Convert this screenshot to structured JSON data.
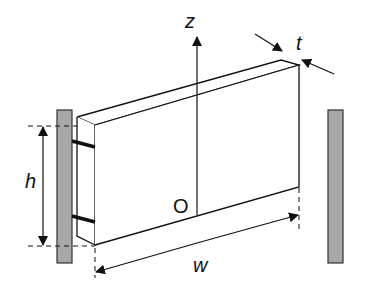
{
  "diagram": {
    "title": "",
    "labels": {
      "z_axis": "z",
      "thickness": "t",
      "height": "h",
      "width": "w",
      "origin": "O"
    },
    "colors": {
      "line": "#111111",
      "wall_fill": "#a8a8a8",
      "wall_stroke": "#333333",
      "background": "#ffffff"
    },
    "elements": [
      {
        "id": "plate",
        "type": "rectangular prism (thin plate)",
        "dims": [
          "w",
          "h",
          "t"
        ]
      },
      {
        "id": "left-support-wall",
        "type": "hatched/gray wall"
      },
      {
        "id": "right-support-wall",
        "type": "hatched/gray wall"
      },
      {
        "id": "connectors",
        "type": "two tie bars from plate to left wall",
        "count": 2
      },
      {
        "id": "z-axis",
        "type": "vertical arrow through origin O"
      }
    ]
  }
}
